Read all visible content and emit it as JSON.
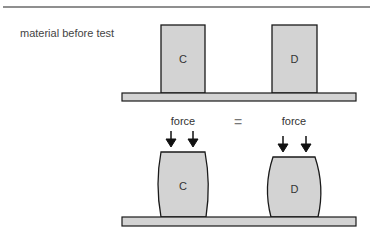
{
  "caption": "material before test",
  "before": {
    "samples": [
      {
        "label": "C"
      },
      {
        "label": "D"
      }
    ]
  },
  "after": {
    "force_left": "force",
    "equals": "=",
    "force_right": "force",
    "samples": [
      {
        "label": "C"
      },
      {
        "label": "D"
      }
    ]
  },
  "colors": {
    "fill": "#d3d3d3",
    "stroke": "#1a1a1a",
    "rule": "#666666"
  }
}
